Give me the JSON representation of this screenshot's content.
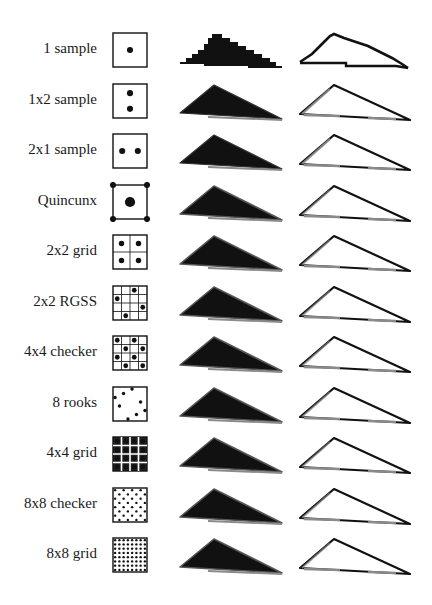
{
  "figure": {
    "colors": {
      "ink": "#111111",
      "gray_edge": "#8a8a8a",
      "background": "#ffffff"
    },
    "rows": [
      {
        "label": "1 sample",
        "pattern": "1-sample",
        "samples": [
          [
            0.5,
            0.5
          ]
        ],
        "dot": 0.09,
        "aa": 0
      },
      {
        "label": "1x2 sample",
        "pattern": "1x2-sample",
        "samples": [
          [
            0.5,
            0.27
          ],
          [
            0.5,
            0.73
          ]
        ],
        "dot": 0.09,
        "aa": 1
      },
      {
        "label": "2x1 sample",
        "pattern": "2x1-sample",
        "samples": [
          [
            0.27,
            0.5
          ],
          [
            0.73,
            0.5
          ]
        ],
        "dot": 0.09,
        "aa": 1
      },
      {
        "label": "Quincunx",
        "pattern": "quincunx",
        "samples": [
          [
            0.5,
            0.5
          ],
          [
            0,
            0
          ],
          [
            1,
            0
          ],
          [
            0,
            1
          ],
          [
            1,
            1
          ]
        ],
        "dot": 0.09,
        "center_dot": 0.15,
        "aa": 2
      },
      {
        "label": "2x2 grid",
        "pattern": "2x2-grid",
        "grid": 2,
        "samples": [
          [
            0.25,
            0.25
          ],
          [
            0.75,
            0.25
          ],
          [
            0.25,
            0.75
          ],
          [
            0.75,
            0.75
          ]
        ],
        "dot": 0.08,
        "aa": 2
      },
      {
        "label": "2x2 RGSS",
        "pattern": "2x2-rgss",
        "grid": 4,
        "samples": [
          [
            0.625,
            0.125
          ],
          [
            0.125,
            0.375
          ],
          [
            0.875,
            0.625
          ],
          [
            0.375,
            0.875
          ]
        ],
        "dot": 0.07,
        "aa": 2
      },
      {
        "label": "4x4 checker",
        "pattern": "4x4-checker",
        "grid": 4,
        "samples": [
          [
            0.125,
            0.125
          ],
          [
            0.625,
            0.125
          ],
          [
            0.375,
            0.375
          ],
          [
            0.875,
            0.375
          ],
          [
            0.125,
            0.625
          ],
          [
            0.625,
            0.625
          ],
          [
            0.375,
            0.875
          ],
          [
            0.875,
            0.875
          ]
        ],
        "dot": 0.07,
        "aa": 3
      },
      {
        "label": "8 rooks",
        "pattern": "8-rooks",
        "samples": [
          [
            0.56,
            0.06
          ],
          [
            0.31,
            0.19
          ],
          [
            0.06,
            0.31
          ],
          [
            0.81,
            0.44
          ],
          [
            0.19,
            0.56
          ],
          [
            0.94,
            0.69
          ],
          [
            0.69,
            0.81
          ],
          [
            0.44,
            0.94
          ]
        ],
        "dot": 0.05,
        "aa": 3
      },
      {
        "label": "4x4 grid",
        "pattern": "4x4-grid",
        "grid": 4,
        "grid_filled": true,
        "samples": "4x4",
        "dot": 0.075,
        "aa": 3
      },
      {
        "label": "8x8 checker",
        "pattern": "8x8-checker",
        "samples": "8x8-checker",
        "dot": 0.035,
        "aa": 3
      },
      {
        "label": "8x8 grid",
        "pattern": "8x8-grid",
        "samples": "8x8",
        "dot": 0.035,
        "aa": 3
      }
    ]
  }
}
